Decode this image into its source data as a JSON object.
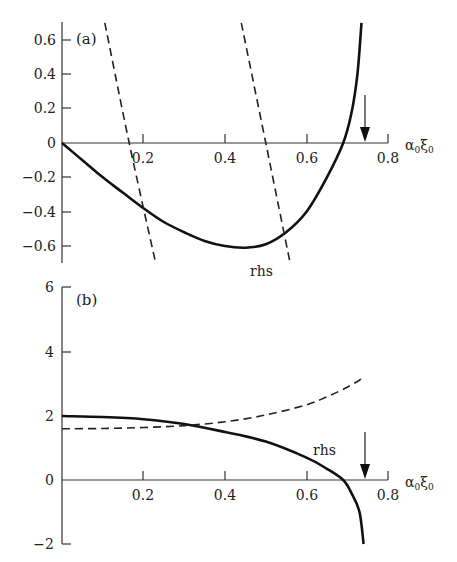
{
  "chart_data": [
    {
      "type": "line",
      "panel_label": "(a)",
      "xlabel": "α₀ξ₀",
      "ylabel": "",
      "xlim": [
        0,
        0.8
      ],
      "ylim": [
        -0.7,
        0.7
      ],
      "x_ticks": [
        "0.2",
        "0.4",
        "0.6",
        "0.8"
      ],
      "y_ticks": [
        "0.6",
        "0.4",
        "0.2",
        "0",
        "−0.2",
        "−0.4",
        "−0.6"
      ],
      "annotations": [
        {
          "text": "rhs",
          "x": 0.42,
          "y": -0.68
        }
      ],
      "arrow_marker_x": 0.745,
      "series": [
        {
          "name": "rhs",
          "style": "solid",
          "x": [
            0,
            0.05,
            0.1,
            0.15,
            0.2,
            0.25,
            0.3,
            0.35,
            0.4,
            0.45,
            0.5,
            0.55,
            0.6,
            0.65,
            0.69,
            0.71,
            0.725,
            0.735
          ],
          "y": [
            0,
            -0.1,
            -0.2,
            -0.29,
            -0.38,
            -0.46,
            -0.52,
            -0.57,
            -0.6,
            -0.61,
            -0.59,
            -0.52,
            -0.4,
            -0.2,
            0,
            0.17,
            0.4,
            0.7
          ]
        },
        {
          "name": "lhs branch 1",
          "style": "dashed",
          "x": [
            0.105,
            0.165,
            0.23
          ],
          "y": [
            0.7,
            0,
            -0.7
          ]
        },
        {
          "name": "lhs branch 2",
          "style": "dashed",
          "x": [
            0.44,
            0.5,
            0.56
          ],
          "y": [
            0.7,
            0,
            -0.7
          ]
        }
      ]
    },
    {
      "type": "line",
      "panel_label": "(b)",
      "xlabel": "α₀ξ₀",
      "ylabel": "",
      "xlim": [
        0,
        0.8
      ],
      "ylim": [
        -2,
        6
      ],
      "x_ticks": [
        "0.2",
        "0.4",
        "0.6",
        "0.8"
      ],
      "y_ticks": [
        "6",
        "4",
        "2",
        "0",
        "−2"
      ],
      "annotations": [
        {
          "text": "rhs",
          "x": 0.62,
          "y": 0.7
        }
      ],
      "arrow_marker_x": 0.745,
      "series": [
        {
          "name": "rhs",
          "style": "solid",
          "x": [
            0,
            0.1,
            0.2,
            0.3,
            0.4,
            0.5,
            0.6,
            0.65,
            0.69,
            0.71,
            0.73,
            0.74
          ],
          "y": [
            2.0,
            1.97,
            1.9,
            1.75,
            1.5,
            1.2,
            0.7,
            0.35,
            0,
            -0.4,
            -1.0,
            -2.0
          ]
        },
        {
          "name": "lhs",
          "style": "dashed",
          "x": [
            0,
            0.1,
            0.2,
            0.3,
            0.4,
            0.5,
            0.6,
            0.65,
            0.7,
            0.74
          ],
          "y": [
            1.6,
            1.61,
            1.64,
            1.7,
            1.82,
            2.03,
            2.35,
            2.6,
            2.9,
            3.2
          ]
        }
      ]
    }
  ],
  "labels": {
    "a_panel": "(a)",
    "b_panel": "(b)",
    "a_rhs": "rhs",
    "b_rhs": "rhs",
    "a_xlabel_main": "α",
    "a_xlabel_sub1": "0",
    "a_xlabel_xi": "ξ",
    "a_xlabel_sub2": "0",
    "b_xlabel_main": "α",
    "b_xlabel_sub1": "0",
    "b_xlabel_xi": "ξ",
    "b_xlabel_sub2": "0",
    "a_yt": [
      "0.6",
      "0.4",
      "0.2",
      "0",
      "−0.2",
      "−0.4",
      "−0.6"
    ],
    "a_xt": [
      "0.2",
      "0.4",
      "0.6",
      "0.8"
    ],
    "b_yt": [
      "6",
      "4",
      "2",
      "0",
      "−2"
    ],
    "b_xt": [
      "0.2",
      "0.4",
      "0.6",
      "0.8"
    ]
  }
}
